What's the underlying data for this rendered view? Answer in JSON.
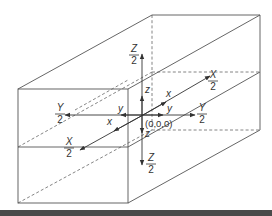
{
  "diagram": {
    "origin_label": "(0,0,0)",
    "axes": {
      "x_positive": {
        "label": "x",
        "extent_num": "X",
        "extent_den": "2"
      },
      "x_negative": {
        "label": "x",
        "extent_num": "X",
        "extent_den": "2"
      },
      "y_positive": {
        "label": "y",
        "extent_num": "Y",
        "extent_den": "2"
      },
      "y_negative": {
        "label": "y",
        "extent_num": "Y",
        "extent_den": "2"
      },
      "z_positive": {
        "label": "z",
        "extent_num": "Z",
        "extent_den": "2"
      },
      "z_negative": {
        "label": "z",
        "extent_num": "Z",
        "extent_den": "2"
      }
    },
    "colors": {
      "line": "#555555",
      "text": "#333333",
      "background": "#ffffff",
      "footer_bar": "#4a4a4a"
    }
  }
}
